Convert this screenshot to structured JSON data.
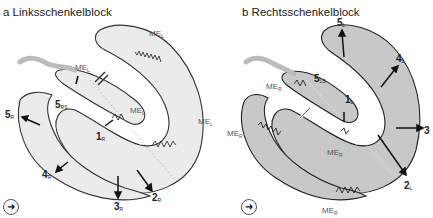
{
  "panels": {
    "a": {
      "title": "a Linksschenkelblock",
      "fill_color": "#ebebeb",
      "labels": {
        "me_top": {
          "main": "ME",
          "sub": "L"
        },
        "me_septal": {
          "main": "ME",
          "sub": "L"
        },
        "me_mid": {
          "main": "ME",
          "sub": "L"
        },
        "me_right": {
          "main": "ME",
          "sub": "L"
        },
        "n5rs": {
          "main": "5",
          "sub": "RS"
        },
        "n1": {
          "main": "1",
          "sub": "R"
        },
        "n5r": {
          "main": "5",
          "sub": "R"
        },
        "n4": {
          "main": "4",
          "sub": "R"
        },
        "n3": {
          "main": "3",
          "sub": "R"
        },
        "n2": {
          "main": "2",
          "sub": "R"
        }
      },
      "nav_icon": "➜"
    },
    "b": {
      "title": "b Rechtsschenkelblock",
      "fill_color": "#c8c8c8",
      "labels": {
        "n5l": {
          "main": "5",
          "sub": "L"
        },
        "n4l": {
          "main": "4",
          "sub": "L"
        },
        "n5ls": {
          "main": "5",
          "sub": "LS"
        },
        "me_r_septal": {
          "main": "ME",
          "sub": "R"
        },
        "n1l": {
          "main": "1",
          "sub": "L"
        },
        "n3": {
          "main": "3",
          "sub": ""
        },
        "me_r_left": {
          "main": "ME",
          "sub": "R"
        },
        "me_r_mid": {
          "main": "ME",
          "sub": "R"
        },
        "n2l": {
          "main": "2",
          "sub": "L"
        },
        "me_r_bottom": {
          "main": "ME",
          "sub": "R"
        }
      },
      "nav_icon": "➜"
    }
  }
}
